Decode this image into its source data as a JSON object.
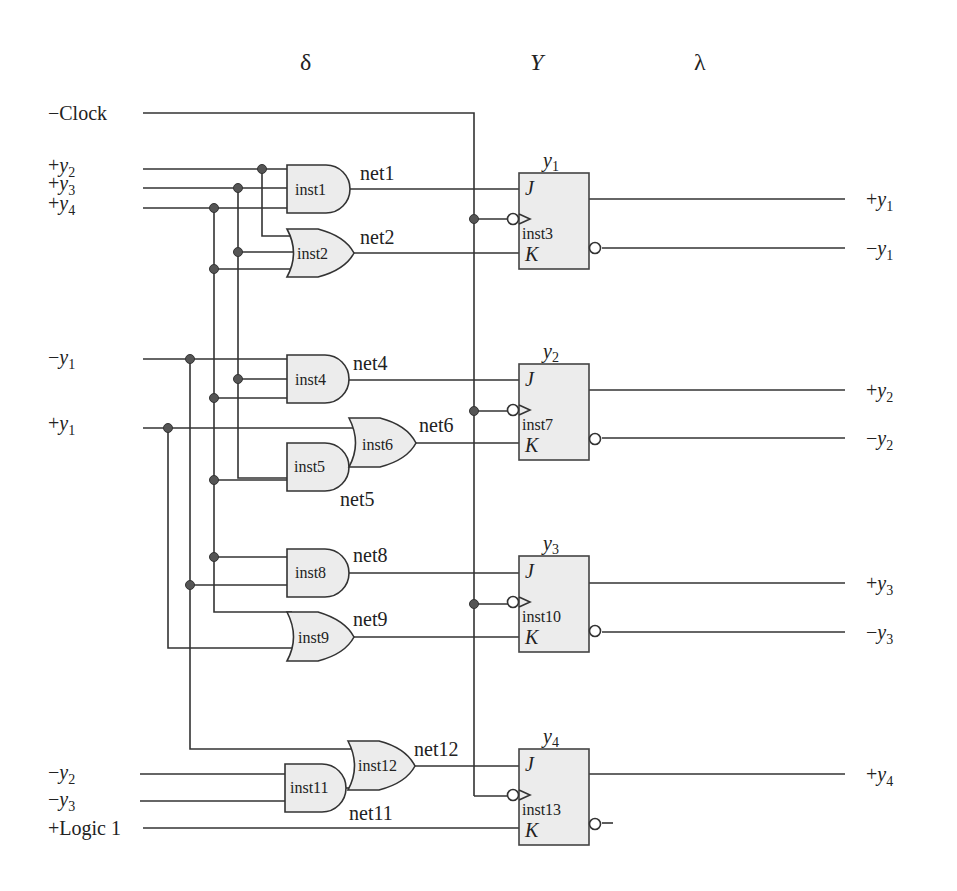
{
  "headers": {
    "delta": "δ",
    "Y": "Y",
    "lambda": "λ"
  },
  "inputs": {
    "clock": {
      "sign": "−",
      "name": "Clock"
    },
    "py2": {
      "sign": "+",
      "var": "y",
      "sub": "2"
    },
    "py3": {
      "sign": "+",
      "var": "y",
      "sub": "3"
    },
    "py4": {
      "sign": "+",
      "var": "y",
      "sub": "4"
    },
    "ny1": {
      "sign": "−",
      "var": "y",
      "sub": "1"
    },
    "py1": {
      "sign": "+",
      "var": "y",
      "sub": "1"
    },
    "ny2": {
      "sign": "−",
      "var": "y",
      "sub": "2"
    },
    "ny3": {
      "sign": "−",
      "var": "y",
      "sub": "3"
    },
    "logic1": {
      "text": "+Logic 1"
    }
  },
  "gates": {
    "inst1": {
      "label": "inst1",
      "type": "AND",
      "net": "net1"
    },
    "inst2": {
      "label": "inst2",
      "type": "OR",
      "net": "net2"
    },
    "inst4": {
      "label": "inst4",
      "type": "AND",
      "net": "net4"
    },
    "inst5": {
      "label": "inst5",
      "type": "AND",
      "net": "net5"
    },
    "inst6": {
      "label": "inst6",
      "type": "OR",
      "net": "net6"
    },
    "inst8": {
      "label": "inst8",
      "type": "AND",
      "net": "net8"
    },
    "inst9": {
      "label": "inst9",
      "type": "OR",
      "net": "net9"
    },
    "inst11": {
      "label": "inst11",
      "type": "AND",
      "net": "net11"
    },
    "inst12": {
      "label": "inst12",
      "type": "OR",
      "net": "net12"
    }
  },
  "flipflops": [
    {
      "label": "inst3",
      "var": "y",
      "sub": "1",
      "j": "J",
      "k": "K"
    },
    {
      "label": "inst7",
      "var": "y",
      "sub": "2",
      "j": "J",
      "k": "K"
    },
    {
      "label": "inst10",
      "var": "y",
      "sub": "3",
      "j": "J",
      "k": "K"
    },
    {
      "label": "inst13",
      "var": "y",
      "sub": "4",
      "j": "J",
      "k": "K"
    }
  ],
  "outputs": [
    {
      "sign": "+",
      "var": "y",
      "sub": "1"
    },
    {
      "sign": "−",
      "var": "y",
      "sub": "1"
    },
    {
      "sign": "+",
      "var": "y",
      "sub": "2"
    },
    {
      "sign": "−",
      "var": "y",
      "sub": "2"
    },
    {
      "sign": "+",
      "var": "y",
      "sub": "3"
    },
    {
      "sign": "−",
      "var": "y",
      "sub": "3"
    },
    {
      "sign": "+",
      "var": "y",
      "sub": "4"
    }
  ]
}
